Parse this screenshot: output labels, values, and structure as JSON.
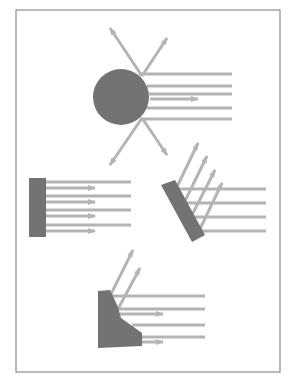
{
  "diagram": {
    "title": "",
    "colors": {
      "background": "#ffffff",
      "frame": "#8c8c8c",
      "object": "#737373",
      "ray": "#b4b4b4"
    },
    "frame": {
      "x": 16,
      "y": 10,
      "w": 264,
      "h": 362
    },
    "panels": [
      {
        "id": "sphere",
        "label": "sphere-scatter",
        "object": {
          "type": "circle",
          "cx": 121,
          "cy": 97,
          "r": 28
        },
        "incoming_rays": [
          {
            "x1": 139,
            "y1": 74,
            "x2": 232,
            "y2": 74
          },
          {
            "x1": 147,
            "y1": 86,
            "x2": 232,
            "y2": 86
          },
          {
            "x1": 149,
            "y1": 94,
            "x2": 232,
            "y2": 94
          },
          {
            "x1": 147,
            "y1": 108,
            "x2": 232,
            "y2": 108
          },
          {
            "x1": 140,
            "y1": 119,
            "x2": 232,
            "y2": 119
          }
        ],
        "reflected_rays": [
          {
            "x1": 150,
            "y1": 99,
            "x2": 198,
            "y2": 99
          },
          {
            "x1": 142,
            "y1": 76,
            "x2": 110,
            "y2": 28
          },
          {
            "x1": 142,
            "y1": 76,
            "x2": 167,
            "y2": 38
          },
          {
            "x1": 142,
            "y1": 118,
            "x2": 110,
            "y2": 165
          },
          {
            "x1": 142,
            "y1": 118,
            "x2": 167,
            "y2": 155
          }
        ]
      },
      {
        "id": "flat-plate",
        "label": "flat-plate-retroreflect",
        "object": {
          "type": "rect",
          "x": 29,
          "y": 178,
          "w": 17,
          "h": 59
        },
        "incoming_rays": [
          {
            "x1": 46,
            "y1": 182,
            "x2": 131,
            "y2": 182
          },
          {
            "x1": 46,
            "y1": 196,
            "x2": 131,
            "y2": 196
          },
          {
            "x1": 46,
            "y1": 210,
            "x2": 131,
            "y2": 210
          },
          {
            "x1": 46,
            "y1": 225,
            "x2": 131,
            "y2": 225
          }
        ],
        "reflected_rays": [
          {
            "x1": 46,
            "y1": 188,
            "x2": 95,
            "y2": 188
          },
          {
            "x1": 46,
            "y1": 202,
            "x2": 95,
            "y2": 202
          },
          {
            "x1": 46,
            "y1": 216,
            "x2": 95,
            "y2": 216
          },
          {
            "x1": 46,
            "y1": 231,
            "x2": 95,
            "y2": 231
          }
        ]
      },
      {
        "id": "tilted-plate",
        "label": "tilted-plate-specular",
        "object": {
          "type": "polygon",
          "points": "161,185 175,180 205,235 192,242"
        },
        "incoming_rays": [
          {
            "x1": 176,
            "y1": 189,
            "x2": 266,
            "y2": 189
          },
          {
            "x1": 184,
            "y1": 203,
            "x2": 266,
            "y2": 203
          },
          {
            "x1": 191,
            "y1": 217,
            "x2": 266,
            "y2": 217
          },
          {
            "x1": 199,
            "y1": 231,
            "x2": 266,
            "y2": 231
          }
        ],
        "reflected_rays": [
          {
            "x1": 176,
            "y1": 189,
            "x2": 198,
            "y2": 143
          },
          {
            "x1": 184,
            "y1": 203,
            "x2": 207,
            "y2": 156
          },
          {
            "x1": 191,
            "y1": 217,
            "x2": 215,
            "y2": 170
          },
          {
            "x1": 199,
            "y1": 231,
            "x2": 222,
            "y2": 183
          }
        ]
      },
      {
        "id": "corner",
        "label": "shaped-body-mixed",
        "object": {
          "type": "polygon",
          "points": "98,291 110,290 118,307 121,318 142,333 142,346 98,348"
        },
        "incoming_rays": [
          {
            "x1": 112,
            "y1": 296,
            "x2": 205,
            "y2": 296
          },
          {
            "x1": 118,
            "y1": 309,
            "x2": 205,
            "y2": 309
          },
          {
            "x1": 132,
            "y1": 325,
            "x2": 205,
            "y2": 325
          },
          {
            "x1": 142,
            "y1": 337,
            "x2": 205,
            "y2": 337
          }
        ],
        "reflected_rays": [
          {
            "x1": 110,
            "y1": 296,
            "x2": 133,
            "y2": 250
          },
          {
            "x1": 118,
            "y1": 309,
            "x2": 140,
            "y2": 268
          },
          {
            "x1": 120,
            "y1": 314,
            "x2": 163,
            "y2": 314
          },
          {
            "x1": 142,
            "y1": 342,
            "x2": 163,
            "y2": 342
          }
        ]
      }
    ]
  }
}
